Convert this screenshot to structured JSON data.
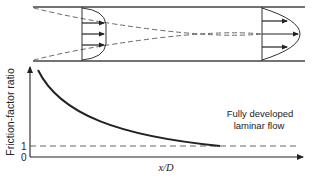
{
  "diagram": {
    "pipe": {
      "inlet_profile": "developing (flat core)",
      "outlet_profile": "fully developed parabolic"
    },
    "graph": {
      "ylabel": "Friction-factor ratio",
      "xlabel": "x/D",
      "y_tick_1": "1",
      "y_tick_0": "0",
      "annotation_line1": "Fully developed",
      "annotation_line2": "laminar flow"
    },
    "colors": {
      "line": "#222222",
      "dashed": "#666666",
      "pipe_wall": "#444444"
    }
  }
}
